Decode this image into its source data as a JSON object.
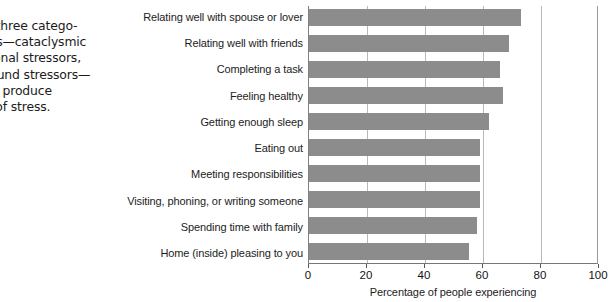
{
  "caption": {
    "heading": "Alert",
    "lines": [
      "ber the three catego-",
      "stressors—cataclysmic",
      "ts, personal stressors,",
      "background stressors—",
      "hat they produce",
      "t levels of stress."
    ]
  },
  "chart_data": {
    "type": "bar",
    "orientation": "horizontal",
    "title": "",
    "xlabel": "Percentage of people experiencing",
    "ylabel": "",
    "xlim": [
      0,
      100
    ],
    "xticks": [
      0,
      20,
      40,
      60,
      80,
      100
    ],
    "xtick_labels": [
      "0",
      "20",
      "40",
      "60",
      "80",
      "100"
    ],
    "grid": true,
    "grid_axis": "x",
    "legend": false,
    "bar_color": "#8c8c8c",
    "categories": [
      "Relating well with spouse or lover",
      "Relating well with friends",
      "Completing a task",
      "Feeling healthy",
      "Getting enough sleep",
      "Eating out",
      "Meeting responsibilities",
      "Visiting, phoning, or writing someone",
      "Spending time with family",
      "Home (inside) pleasing to you"
    ],
    "values": [
      73,
      69,
      66,
      67,
      62,
      59,
      59,
      59,
      58,
      55
    ]
  }
}
